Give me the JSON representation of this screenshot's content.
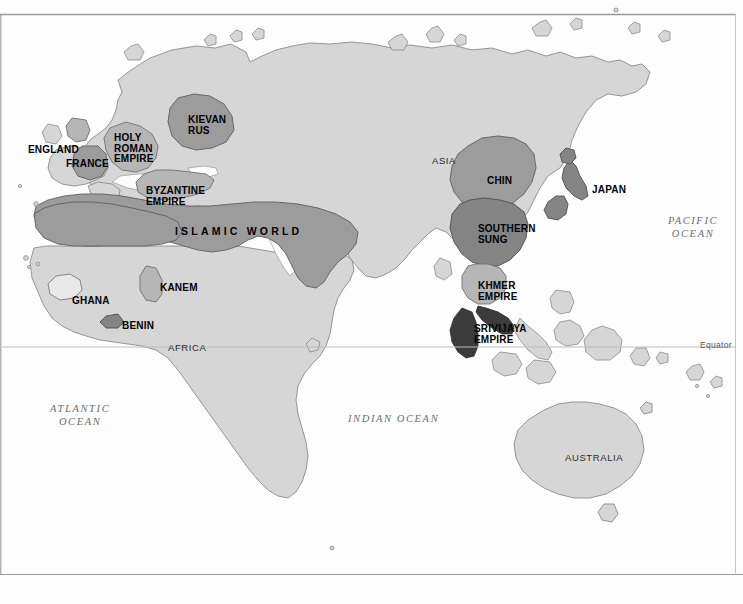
{
  "map": {
    "title": "World map c. 1200 CE showing major empires and states",
    "background_color": "#fdfdfd",
    "frame_color": "#9a9a9a",
    "palette": {
      "land": "#d6d6d6",
      "land_outline": "#8c8c8c",
      "shade_light": "#e6e6e6",
      "shade_mid": "#b4b4b4",
      "shade_dark": "#9b9b9b",
      "shade_darker": "#7d7d7d",
      "shade_darkest": "#3a3a3a",
      "label_black": "#000000",
      "ocean_text": "#6e6e6e",
      "continent_text": "#2b2b2b"
    },
    "equator": {
      "label": "Equator",
      "y": 347,
      "line_color": "#bdbdbd"
    },
    "empire_labels": [
      {
        "name": "england",
        "text": "ENGLAND",
        "x": 28,
        "y": 145,
        "align": "left",
        "wide": false
      },
      {
        "name": "holy-roman-empire",
        "text": "HOLY\nROMAN\nEMPIRE",
        "x": 114,
        "y": 133,
        "align": "left",
        "wide": false
      },
      {
        "name": "france",
        "text": "FRANCE",
        "x": 66,
        "y": 159,
        "align": "left",
        "wide": false
      },
      {
        "name": "kievan-rus",
        "text": "KIEVAN\nRUS",
        "x": 188,
        "y": 115,
        "align": "left",
        "wide": false
      },
      {
        "name": "byzantine-empire",
        "text": "BYZANTINE\nEMPIRE",
        "x": 146,
        "y": 186,
        "align": "left",
        "wide": false
      },
      {
        "name": "islamic-world",
        "text": "ISLAMIC   WORLD",
        "x": 175,
        "y": 226,
        "align": "left",
        "wide": true
      },
      {
        "name": "ghana",
        "text": "GHANA",
        "x": 72,
        "y": 296,
        "align": "left",
        "wide": false
      },
      {
        "name": "kanem",
        "text": "KANEM",
        "x": 160,
        "y": 283,
        "align": "left",
        "wide": false
      },
      {
        "name": "benin",
        "text": "BENIN",
        "x": 122,
        "y": 321,
        "align": "left",
        "wide": false
      },
      {
        "name": "chin",
        "text": "CHIN",
        "x": 487,
        "y": 176,
        "align": "left",
        "wide": false
      },
      {
        "name": "southern-sung",
        "text": "SOUTHERN\nSUNG",
        "x": 478,
        "y": 224,
        "align": "left",
        "wide": false
      },
      {
        "name": "japan",
        "text": "JAPAN",
        "x": 592,
        "y": 185,
        "align": "left",
        "wide": false
      },
      {
        "name": "khmer-empire",
        "text": "KHMER\nEMPIRE",
        "x": 478,
        "y": 281,
        "align": "left",
        "wide": false
      },
      {
        "name": "srivijaya-empire",
        "text": "SRIVIJAYA\nEMPIRE",
        "x": 474,
        "y": 324,
        "align": "left",
        "wide": false
      }
    ],
    "continent_labels": [
      {
        "name": "asia",
        "text": "ASIA",
        "x": 432,
        "y": 155
      },
      {
        "name": "africa",
        "text": "AFRICA",
        "x": 168,
        "y": 342
      },
      {
        "name": "australia",
        "text": "AUSTRALIA",
        "x": 565,
        "y": 452
      }
    ],
    "ocean_labels": [
      {
        "name": "pacific-ocean",
        "text": "PACIFIC\nOCEAN",
        "x": 668,
        "y": 214
      },
      {
        "name": "atlantic-ocean",
        "text": "ATLANTIC\nOCEAN",
        "x": 50,
        "y": 402
      },
      {
        "name": "indian-ocean",
        "text": "INDIAN  OCEAN",
        "x": 348,
        "y": 412
      }
    ]
  }
}
